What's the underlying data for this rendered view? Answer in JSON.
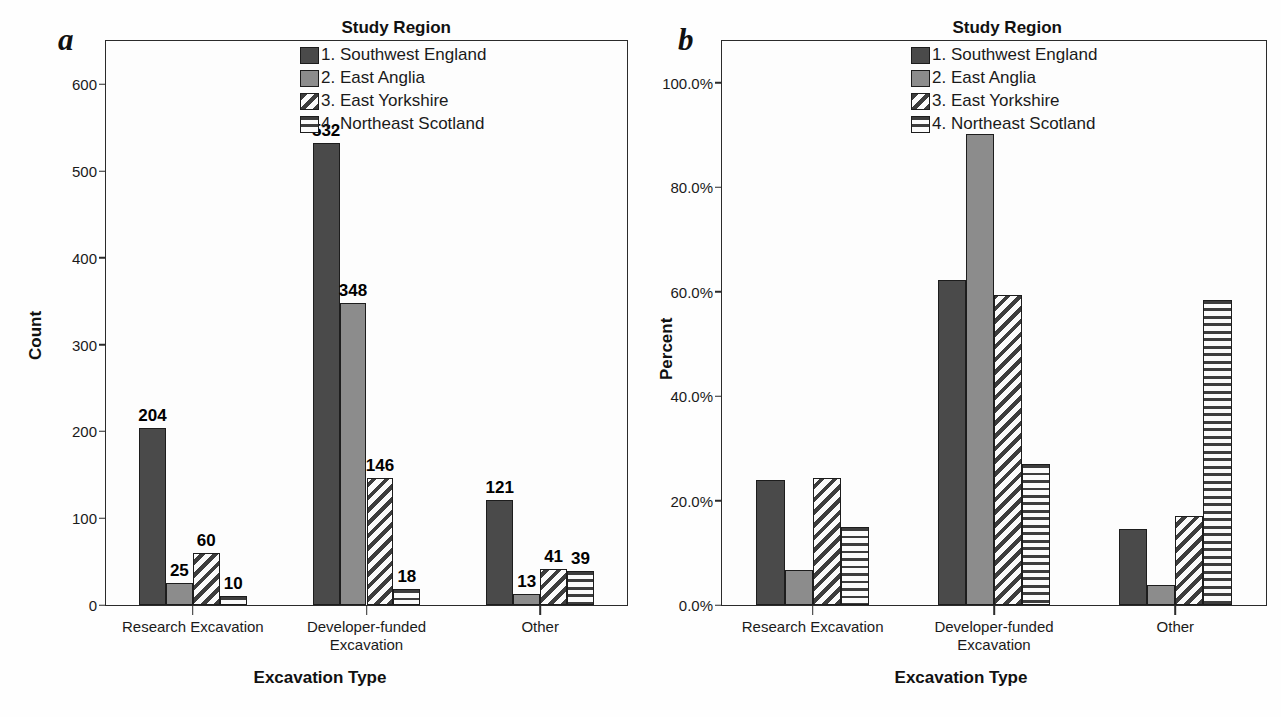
{
  "figure": {
    "panels": [
      {
        "letter": "a",
        "legend_title": "Study Region",
        "chart_index": 0
      },
      {
        "letter": "b",
        "legend_title": "Study Region",
        "chart_index": 1
      }
    ],
    "series_names": [
      "1. Southwest England",
      "2. East Anglia",
      "3. East Yorkshire",
      "4. Northeast Scotland"
    ],
    "series_fill_names": [
      "solid-dark",
      "solid-gray",
      "diagonal-hatch",
      "horizontal-hatch"
    ],
    "colors": {
      "series_1": "#4a4a4a",
      "series_2": "#8c8c8c",
      "hatch_ink": "#3d3d3d",
      "hatch_background": "#fbfbfb",
      "axis": "#2b2b2b",
      "text": "#111111",
      "plot_background": "#fdfdfd"
    }
  },
  "chart_data": [
    {
      "type": "bar",
      "title": "",
      "panel_letter": "a",
      "xlabel": "Excavation Type",
      "ylabel": "Count",
      "categories": [
        "Research Excavation",
        "Developer-funded Excavation",
        "Other"
      ],
      "category_lines": [
        [
          "Research Excavation"
        ],
        [
          "Developer-funded",
          "Excavation"
        ],
        [
          "Other"
        ]
      ],
      "ylim": [
        0,
        650
      ],
      "yticks": [
        0,
        100,
        200,
        300,
        400,
        500,
        600
      ],
      "ytick_labels": [
        "0",
        "100",
        "200",
        "300",
        "400",
        "500",
        "600"
      ],
      "grid": false,
      "legend_position": "top-right",
      "show_value_labels": true,
      "series": [
        {
          "name": "1. Southwest England",
          "values": [
            204,
            532,
            121
          ],
          "labels": [
            "204",
            "532",
            "121"
          ]
        },
        {
          "name": "2. East Anglia",
          "values": [
            25,
            348,
            13
          ],
          "labels": [
            "25",
            "348",
            "13"
          ]
        },
        {
          "name": "3. East Yorkshire",
          "values": [
            60,
            146,
            41
          ],
          "labels": [
            "60",
            "146",
            "41"
          ]
        },
        {
          "name": "4. Northeast Scotland",
          "values": [
            10,
            18,
            39
          ],
          "labels": [
            "10",
            "18",
            "39"
          ]
        }
      ]
    },
    {
      "type": "bar",
      "title": "",
      "panel_letter": "b",
      "xlabel": "Excavation Type",
      "ylabel": "Percent",
      "categories": [
        "Research Excavation",
        "Developer-funded Excavation",
        "Other"
      ],
      "category_lines": [
        [
          "Research Excavation"
        ],
        [
          "Developer-funded",
          "Excavation"
        ],
        [
          "Other"
        ]
      ],
      "ylim": [
        0,
        108
      ],
      "yticks": [
        0,
        20,
        40,
        60,
        80,
        100
      ],
      "ytick_labels": [
        "0.0%",
        "20.0%",
        "40.0%",
        "60.0%",
        "80.0%",
        "100.0%"
      ],
      "grid": false,
      "legend_position": "top-right",
      "show_value_labels": false,
      "series": [
        {
          "name": "1. Southwest England",
          "values": [
            23.9,
            62.2,
            14.5
          ]
        },
        {
          "name": "2. East Anglia",
          "values": [
            6.7,
            90.2,
            3.9
          ]
        },
        {
          "name": "3. East Yorkshire",
          "values": [
            24.4,
            59.3,
            17.0
          ]
        },
        {
          "name": "4. Northeast Scotland",
          "values": [
            15.0,
            27.0,
            58.5
          ]
        }
      ]
    }
  ]
}
